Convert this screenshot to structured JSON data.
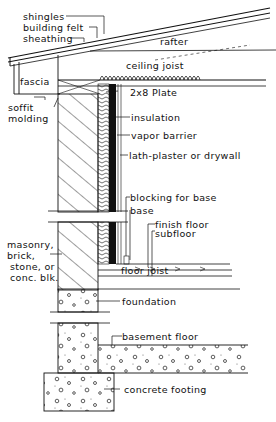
{
  "colors": {
    "ink": "#111111",
    "paper": "#ffffff"
  },
  "labels": {
    "shingles": "shingles",
    "building_felt": "building felt",
    "sheathing": "sheathing",
    "rafter": "rafter",
    "ceiling_joist": "ceiling joist",
    "fascia": "fascia",
    "plate": "2x8 Plate",
    "soffit": "soffit",
    "molding": "molding",
    "insulation": "insulation",
    "vapor_barrier": "vapor barrier",
    "lath_plaster": "lath-plaster or drywall",
    "blocking_for_base": "blocking for base",
    "base": "base",
    "finish_floor": "finish floor",
    "subfloor": "subfloor",
    "masonry_1": "masonry,",
    "masonry_2": "brick,",
    "masonry_3": "stone, or",
    "masonry_4": "conc. blk.",
    "floor_joist": "floor joist",
    "foundation": "foundation",
    "basement_floor": "basement floor",
    "concrete_footing": "concrete footing"
  }
}
